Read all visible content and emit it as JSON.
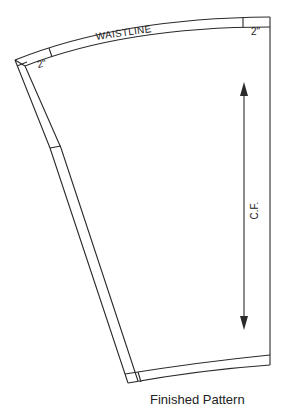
{
  "diagram": {
    "labels": {
      "waistline": "WAISTLINE",
      "seam_allowance_left": "2\"",
      "seam_allowance_right": "2\"",
      "center_front": "C.F."
    },
    "caption": "Finished Pattern",
    "colors": {
      "line": "#2a2a2a",
      "background": "#ffffff"
    }
  }
}
